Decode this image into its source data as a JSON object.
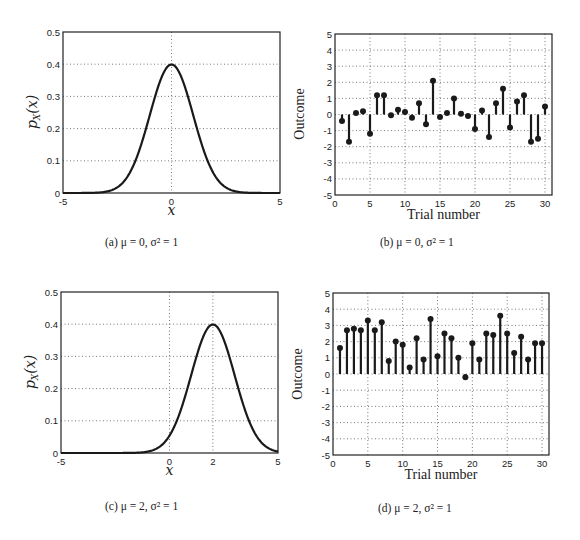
{
  "figures": [
    {
      "id": "a",
      "caption": "(a) μ = 0, σ² = 1"
    },
    {
      "id": "b",
      "caption": "(b) μ = 0, σ² = 1"
    },
    {
      "id": "c",
      "caption": "(c) μ = 2, σ² = 1"
    },
    {
      "id": "d",
      "caption": "(d) μ = 2, σ² = 1"
    }
  ],
  "chart_data": [
    {
      "id": "a",
      "type": "line",
      "title": "",
      "xlabel": "x",
      "ylabel": "p_X(x)",
      "xlim": [
        -5,
        5
      ],
      "ylim": [
        0,
        0.5
      ],
      "xticks": [
        -5,
        0,
        5
      ],
      "yticks": [
        0,
        0.1,
        0.2,
        0.3,
        0.4,
        0.5
      ],
      "xtick_labels": [
        "-5",
        "0",
        "5"
      ],
      "ytick_labels": [
        "0",
        "0.1",
        "0.2",
        "0.3",
        "0.4",
        "0.5"
      ],
      "grid": true,
      "grid_x": [
        0
      ],
      "series": [
        {
          "name": "Gaussian pdf",
          "mu": 0,
          "sigma2": 1,
          "peak": 0.399
        }
      ]
    },
    {
      "id": "b",
      "type": "stem",
      "title": "",
      "xlabel": "Trial number",
      "ylabel": "Outcome",
      "xlim": [
        0,
        31
      ],
      "ylim": [
        -5,
        5
      ],
      "xticks": [
        0,
        5,
        10,
        15,
        20,
        25,
        30
      ],
      "yticks": [
        -5,
        -4,
        -3,
        -2,
        -1,
        0,
        1,
        2,
        3,
        4,
        5
      ],
      "grid": true,
      "x": [
        1,
        2,
        3,
        4,
        5,
        6,
        7,
        8,
        9,
        10,
        11,
        12,
        13,
        14,
        15,
        16,
        17,
        18,
        19,
        20,
        21,
        22,
        23,
        24,
        25,
        26,
        27,
        28,
        29,
        30
      ],
      "values": [
        -0.4,
        -1.7,
        0.1,
        0.2,
        -1.2,
        1.2,
        1.2,
        -0.05,
        0.3,
        0.15,
        -0.2,
        0.7,
        -0.6,
        2.1,
        -0.15,
        0.1,
        1.0,
        0.05,
        -0.1,
        -0.9,
        0.25,
        -1.4,
        0.7,
        1.6,
        -0.8,
        0.8,
        1.2,
        -1.7,
        -1.5,
        0.5
      ]
    },
    {
      "id": "c",
      "type": "line",
      "title": "",
      "xlabel": "x",
      "ylabel": "p_X(x)",
      "xlim": [
        -5,
        5
      ],
      "ylim": [
        0,
        0.5
      ],
      "xticks": [
        -5,
        0,
        2,
        5
      ],
      "yticks": [
        0,
        0.1,
        0.2,
        0.3,
        0.4,
        0.5
      ],
      "xtick_labels": [
        "-5",
        "0",
        "2",
        "5"
      ],
      "ytick_labels": [
        "0",
        "0.1",
        "0.2",
        "0.3",
        "0.4",
        "0.5"
      ],
      "grid": true,
      "grid_x": [
        0,
        2
      ],
      "series": [
        {
          "name": "Gaussian pdf",
          "mu": 2,
          "sigma2": 1,
          "peak": 0.399
        }
      ]
    },
    {
      "id": "d",
      "type": "stem",
      "title": "",
      "xlabel": "Trial number",
      "ylabel": "Outcome",
      "xlim": [
        0,
        31
      ],
      "ylim": [
        -5,
        5
      ],
      "xticks": [
        0,
        5,
        10,
        15,
        20,
        25,
        30
      ],
      "yticks": [
        -5,
        -4,
        -3,
        -2,
        -1,
        0,
        1,
        2,
        3,
        4,
        5
      ],
      "grid": true,
      "x": [
        1,
        2,
        3,
        4,
        5,
        6,
        7,
        8,
        9,
        10,
        11,
        12,
        13,
        14,
        15,
        16,
        17,
        18,
        19,
        20,
        21,
        22,
        23,
        24,
        25,
        26,
        27,
        28,
        29,
        30
      ],
      "values": [
        1.6,
        2.7,
        2.8,
        2.7,
        3.3,
        2.7,
        3.2,
        0.8,
        2.0,
        1.8,
        0.4,
        2.2,
        0.9,
        3.4,
        1.1,
        2.5,
        2.2,
        1.0,
        -0.2,
        1.9,
        0.9,
        2.5,
        2.4,
        3.6,
        2.5,
        1.3,
        2.3,
        0.9,
        1.9,
        1.9
      ]
    }
  ]
}
